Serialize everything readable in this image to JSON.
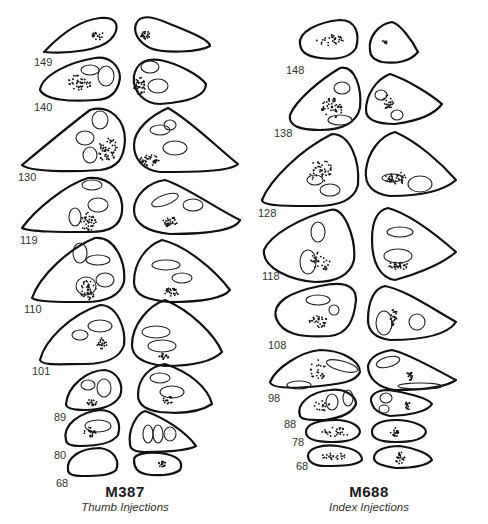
{
  "panels": [
    {
      "id": "M387",
      "title": "M387",
      "subtitle": "Thumb Injections",
      "section_labels": [
        "149",
        "140",
        "130",
        "119",
        "110",
        "101",
        "89",
        "80",
        "68"
      ]
    },
    {
      "id": "M688",
      "title": "M688",
      "subtitle": "Index Injections",
      "section_labels": [
        "148",
        "138",
        "128",
        "118",
        "108",
        "98",
        "88",
        "78",
        "68"
      ]
    }
  ],
  "colors": {
    "outline": "#111111",
    "background": "#ffffff",
    "label": "#333333"
  }
}
